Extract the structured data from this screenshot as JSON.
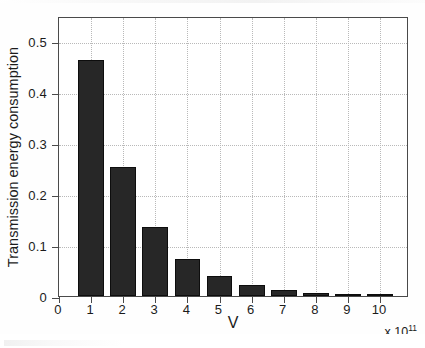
{
  "chart_data": {
    "type": "bar",
    "title": "",
    "subtitle": "",
    "xlabel": "V",
    "ylabel": "Transmission energy consumption",
    "x_axis_multiplier": "x 10",
    "x_axis_multiplier_exponent": "11",
    "categories": [
      "1",
      "2",
      "3",
      "4",
      "5",
      "6",
      "7",
      "8",
      "9",
      "10"
    ],
    "values": [
      0.463,
      0.253,
      0.136,
      0.072,
      0.039,
      0.021,
      0.011,
      0.006,
      0.003,
      0.0015
    ],
    "xtick_labels": [
      "0",
      "1",
      "2",
      "3",
      "4",
      "5",
      "6",
      "7",
      "8",
      "9",
      "10"
    ],
    "xtick_values": [
      0,
      1,
      2,
      3,
      4,
      5,
      6,
      7,
      8,
      9,
      10
    ],
    "ytick_labels": [
      "0",
      "0.1",
      "0.2",
      "0.3",
      "0.4",
      "0.5"
    ],
    "ytick_values": [
      0,
      0.1,
      0.2,
      0.3,
      0.4,
      0.5
    ],
    "xlim": [
      0,
      10.9
    ],
    "ylim": [
      0,
      0.55
    ],
    "grid": true,
    "grid_style": "dotted",
    "legend": null,
    "bar_color": "#272727",
    "bar_edge_color": "#0d0d0d",
    "grid_color": "#b9b9b9",
    "axis_color": "#4a4a4a",
    "background_color": "#ffffff",
    "bar_width_fraction": 0.8
  }
}
